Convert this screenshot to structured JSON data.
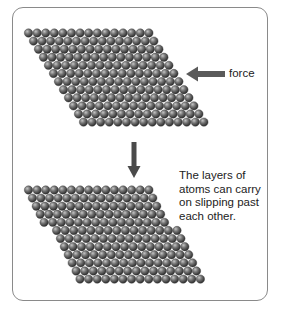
{
  "diagram": {
    "force_label": "force",
    "caption_lines": [
      "The layers of",
      "atoms can carry",
      "on slipping past",
      "each other."
    ],
    "colors": {
      "frame_border": "#8a8a8a",
      "atom_light": "#b8b8b8",
      "atom_mid": "#6e6e6e",
      "atom_dark": "#2e2e2e",
      "arrow": "#5a5a5a"
    },
    "top_lattice": {
      "rows": 12,
      "atoms_per_row": 15,
      "origin_x": 28.5,
      "origin_y": 33,
      "atom_diameter": 8.6,
      "row_height": 8.1,
      "row_shift": 5.0,
      "slip_after_row": null,
      "slip_offset": 0
    },
    "bottom_lattice": {
      "rows": 12,
      "atoms_per_row": 15,
      "origin_x": 28.5,
      "origin_y": 190,
      "atom_diameter": 8.6,
      "row_height": 8.1,
      "row_shift": 3.9,
      "slip_after_row": 5,
      "slip_offset": 8.6
    },
    "force_arrow": {
      "direction": "left",
      "x1": 225,
      "x2": 186,
      "y": 74
    },
    "down_arrow": {
      "direction": "down",
      "x": 134,
      "y1": 142,
      "y2": 178
    }
  }
}
